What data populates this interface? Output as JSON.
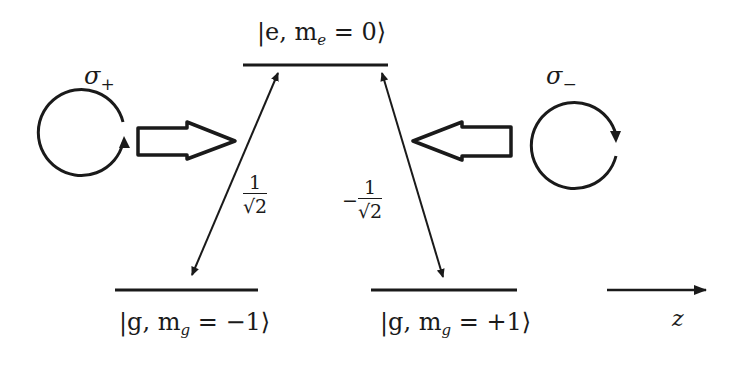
{
  "levels": {
    "excited": {
      "label_prefix": "|e, m",
      "label_sub": "e",
      "label_suffix": " = 0⟩"
    },
    "ground_left": {
      "label_prefix": "|g, m",
      "label_sub": "g",
      "label_suffix": " = −1⟩"
    },
    "ground_right": {
      "label_prefix": "|g, m",
      "label_sub": "g",
      "label_suffix": " = +1⟩"
    }
  },
  "couplings": {
    "left": {
      "sign": "",
      "numerator": "1",
      "denominator": "√2"
    },
    "right": {
      "sign": "−",
      "numerator": "1",
      "denominator": "√2"
    }
  },
  "beams": {
    "left": {
      "symbol": "σ",
      "subscript": "+",
      "direction": "right"
    },
    "right": {
      "symbol": "σ",
      "subscript": "−",
      "direction": "left"
    }
  },
  "axis": {
    "label": "z"
  },
  "colors": {
    "stroke": "#1a1a1a",
    "background": "#ffffff"
  }
}
